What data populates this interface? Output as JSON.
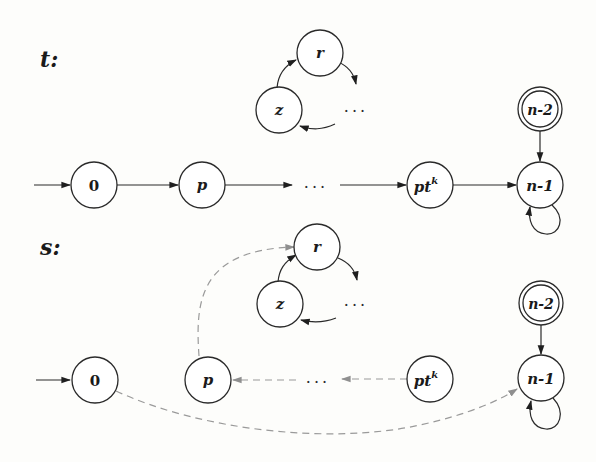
{
  "diagram": {
    "sections": [
      {
        "id": "t",
        "label": "t:",
        "nodes": {
          "start": {
            "label": "0"
          },
          "p": {
            "label": "p"
          },
          "ptk": {
            "label": "pt",
            "sup": "k"
          },
          "n1": {
            "label": "n-1"
          },
          "n2": {
            "label": "n-2",
            "accepting": true
          },
          "r": {
            "label": "r"
          },
          "z": {
            "label": "z"
          }
        },
        "ellipses": [
          "···",
          "···"
        ],
        "edge_style": "solid"
      },
      {
        "id": "s",
        "label": "s:",
        "nodes": {
          "start": {
            "label": "0"
          },
          "p": {
            "label": "p"
          },
          "ptk": {
            "label": "pt",
            "sup": "k"
          },
          "n1": {
            "label": "n-1"
          },
          "n2": {
            "label": "n-2",
            "accepting": true
          },
          "r": {
            "label": "r"
          },
          "z": {
            "label": "z"
          }
        },
        "ellipses": [
          "···",
          "···"
        ],
        "edge_style": "dashed (reversed/rewired)"
      }
    ],
    "edges_t": [
      "→ 0",
      "0 → p",
      "p → ···",
      "··· → pt^k",
      "pt^k → n-1",
      "n-2 → n-1",
      "n-1 → n-1 (self-loop)",
      "z → r",
      "r → ···",
      "··· → z"
    ],
    "edges_s": [
      "→ 0",
      "0 ⇢ n-1 (dashed)",
      "p ⇢ r (dashed)",
      "··· ⇢ p (dashed)",
      "pt^k ⇢ ··· (dashed)",
      "n-2 → n-1",
      "n-1 → n-1 (self-loop)",
      "z → r",
      "r → ···",
      "··· → z"
    ],
    "colors": {
      "solid_edge": "#2a2a2a",
      "dashed_edge": "#9a9a9a",
      "background": "#fdfdfb"
    }
  }
}
